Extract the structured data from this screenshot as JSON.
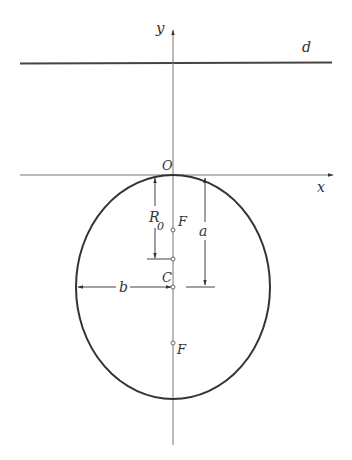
{
  "diagram": {
    "type": "ellipse-geometry",
    "labels": {
      "y_axis": "y",
      "x_axis": "x",
      "directrix": "d",
      "origin": "O",
      "radius": "R",
      "radius_sub": "0",
      "focus_top": "F",
      "focus_bottom": "F",
      "center": "C",
      "semi_axis_a": "a",
      "semi_axis_b": "b"
    },
    "colors": {
      "stroke": "#333333",
      "axis": "#666666",
      "background": "#ffffff"
    }
  }
}
